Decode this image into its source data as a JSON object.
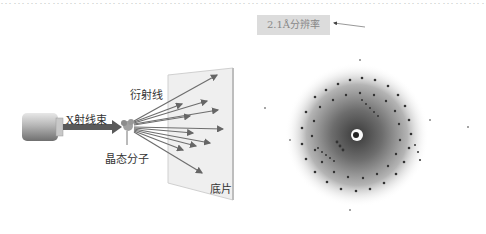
{
  "header": {
    "partial_text": "………………………………………………………………………………………………………………………………"
  },
  "left_diagram": {
    "beam_label": "X射线束",
    "diffracted_label": "衍射线",
    "crystal_label": "晶态分子",
    "film_label": "底片"
  },
  "right_panel": {
    "resolution_label": "2.1Å分辨率"
  },
  "colors": {
    "beam": "#555555",
    "rays": "#6e6e6e",
    "film": "#ececec",
    "box": "#dcdcdc",
    "halo": "#7a7a7a"
  }
}
